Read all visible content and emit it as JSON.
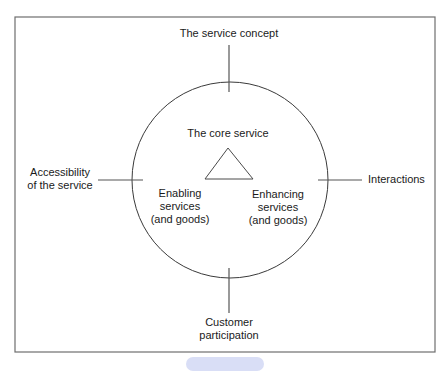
{
  "diagram": {
    "type": "concept-diagram",
    "center_label": "The core service",
    "top_label": "The service concept",
    "left_label": {
      "line1": "Accessibility",
      "line2": "of the service"
    },
    "right_label": "Interactions",
    "bottom_label": {
      "line1": "Customer",
      "line2": "participation"
    },
    "inner_left_label": {
      "line1": "Enabling",
      "line2": "services",
      "line3": "(and goods)"
    },
    "inner_right_label": {
      "line1": "Enhancing",
      "line2": "services",
      "line3": "(and goods)"
    },
    "colors": {
      "frame": "#6e6e6e",
      "circle": "#3a3a3a",
      "text": "#1a1a1a",
      "bottom_chip": "#d9def6"
    }
  }
}
